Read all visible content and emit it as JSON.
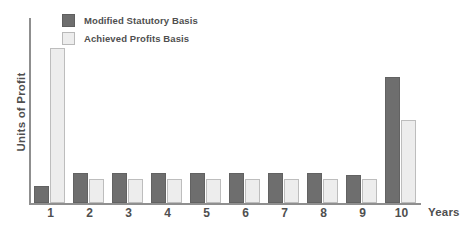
{
  "chart_data": {
    "type": "bar",
    "title": "",
    "xlabel": "Years",
    "ylabel": "Units of Profit",
    "categories": [
      "1",
      "2",
      "3",
      "4",
      "5",
      "6",
      "7",
      "8",
      "9",
      "10"
    ],
    "series": [
      {
        "name": "Modified Statutory Basis",
        "color": "#6e6e6e",
        "values": [
          9,
          16,
          16,
          16,
          16,
          16,
          16,
          16,
          15,
          68
        ]
      },
      {
        "name": "Achieved Profits Basis",
        "color": "#ededed",
        "values": [
          84,
          13,
          13,
          13,
          13,
          13,
          13,
          13,
          13,
          45
        ]
      }
    ],
    "ylim": [
      0,
      100
    ],
    "grid": false,
    "legend_position": "top-left",
    "y_tick_labels": [],
    "x_tick_labels": [
      "1",
      "2",
      "3",
      "4",
      "5",
      "6",
      "7",
      "8",
      "9",
      "10"
    ]
  },
  "legend": {
    "items": [
      {
        "label": "Modified Statutory Basis",
        "swatch": "dark-gray-square",
        "color": "#6e6e6e"
      },
      {
        "label": "Achieved Profits Basis",
        "swatch": "light-gray-square",
        "color": "#ededed"
      }
    ]
  },
  "axes": {
    "y_title": "Units of Profit",
    "x_title": "Years"
  },
  "colors": {
    "series_dark": "#6e6e6e",
    "series_light": "#ededed",
    "axis": "#8f8f8f",
    "text": "#4f4f4f",
    "background": "#ffffff"
  }
}
